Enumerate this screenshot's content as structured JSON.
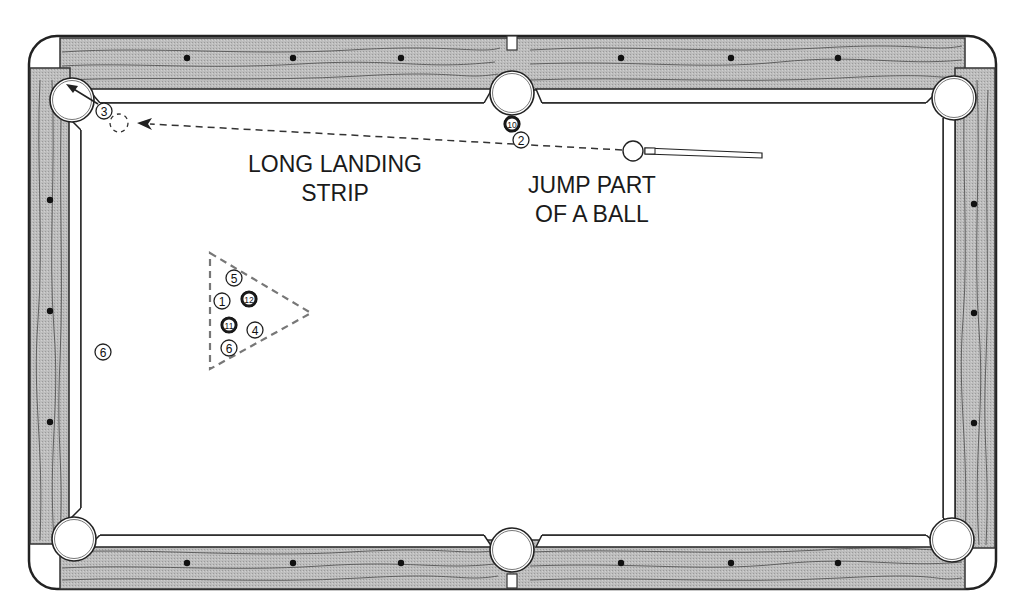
{
  "diagram": {
    "type": "pool-table-shot-diagram",
    "colors": {
      "rail_wood": "#b9b9b9",
      "outline": "#222222",
      "cloth": "#ffffff",
      "ball_solid_fill": "#1a1a1a"
    },
    "annotations": [
      {
        "id": "landing",
        "lines": [
          "LONG LANDING",
          "STRIP"
        ],
        "x": 335,
        "y": 150
      },
      {
        "id": "jump",
        "lines": [
          "JUMP PART",
          "OF A BALL"
        ],
        "x": 592,
        "y": 171
      }
    ],
    "diamonds": {
      "top": [
        187,
        293,
        401,
        621,
        731,
        838
      ],
      "bottom": [
        187,
        293,
        401,
        621,
        731,
        838
      ],
      "left": [
        200,
        311,
        422
      ],
      "right": [
        204,
        313,
        423
      ]
    },
    "pockets": [
      {
        "id": "top-left",
        "x": 72,
        "y": 100
      },
      {
        "id": "top-side",
        "x": 512,
        "y": 93
      },
      {
        "id": "top-right",
        "x": 954,
        "y": 98
      },
      {
        "id": "bottom-left",
        "x": 74,
        "y": 539
      },
      {
        "id": "bottom-side",
        "x": 512,
        "y": 550
      },
      {
        "id": "bottom-right",
        "x": 952,
        "y": 540
      }
    ],
    "balls": [
      {
        "number": "3",
        "x": 104,
        "y": 111,
        "solid": false
      },
      {
        "number": "10",
        "x": 512,
        "y": 124,
        "solid": true
      },
      {
        "number": "2",
        "x": 521,
        "y": 140,
        "solid": false
      },
      {
        "number": "5",
        "x": 234,
        "y": 278,
        "solid": false
      },
      {
        "number": "1",
        "x": 222,
        "y": 301,
        "solid": false
      },
      {
        "number": "12",
        "x": 249,
        "y": 299,
        "solid": true
      },
      {
        "number": "11",
        "x": 229,
        "y": 325,
        "solid": true
      },
      {
        "number": "4",
        "x": 255,
        "y": 330,
        "solid": false
      },
      {
        "number": "6",
        "x": 229,
        "y": 348,
        "solid": false
      },
      {
        "number": "6",
        "x": 103,
        "y": 352,
        "solid": false
      }
    ],
    "cue_ball": {
      "x": 633,
      "y": 151
    },
    "ghost_ball": {
      "x": 119,
      "y": 123
    },
    "cue_stick": {
      "tip_x": 645,
      "tip_y": 151,
      "end_x": 762,
      "end_y": 156
    }
  }
}
